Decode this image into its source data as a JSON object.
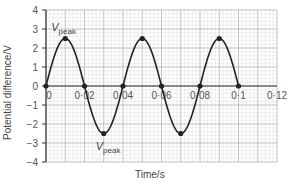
{
  "chart_data": {
    "type": "line",
    "title": "",
    "xlabel": "Time/s",
    "ylabel": "Potential difference/V",
    "xlim": [
      0,
      0.12
    ],
    "ylim": [
      -4,
      4
    ],
    "grid": true,
    "x_ticks": [
      "0",
      "0·02",
      "0·04",
      "0·06",
      "0·08",
      "0·1",
      "0·12"
    ],
    "y_ticks": [
      "4",
      "3",
      "2",
      "1",
      "0",
      "−1",
      "−2",
      "−3",
      "−4"
    ],
    "series": [
      {
        "name": "sine wave",
        "amplitude": 2.5,
        "period": 0.04,
        "x": [
          0,
          0.01,
          0.02,
          0.03,
          0.04,
          0.05,
          0.06,
          0.07,
          0.08,
          0.09,
          0.1
        ],
        "values": [
          0,
          2.5,
          0,
          -2.5,
          0,
          2.5,
          0,
          -2.5,
          0,
          2.5,
          0
        ]
      }
    ],
    "annotations": [
      {
        "text": "V",
        "subscript": "peak",
        "x": 0.01,
        "y": 2.5,
        "position": "above-left"
      },
      {
        "text": "V",
        "subscript": "peak",
        "x": 0.03,
        "y": -2.5,
        "position": "below"
      }
    ],
    "colors": {
      "line": "#222222",
      "grid_minor": "#d6d6d6",
      "grid_major": "#a8a8a8",
      "axis": "#333333"
    }
  }
}
